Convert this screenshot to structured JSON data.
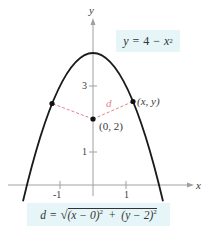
{
  "figure": {
    "axes": {
      "x_label": "x",
      "y_label": "y",
      "x_ticks": [
        {
          "value": -1,
          "label": "-1"
        },
        {
          "value": 1,
          "label": "1"
        }
      ],
      "y_ticks": [
        {
          "value": 1,
          "label": "1"
        },
        {
          "value": 3,
          "label": "3"
        }
      ]
    },
    "curve": {
      "equation_label": "y = 4 − x²",
      "equation_lhs": "y",
      "equation_eq": "=",
      "equation_rhs_const": "4",
      "equation_minus": "−",
      "equation_rhs_var": "x",
      "equation_rhs_exp": "2",
      "color": "#1a1a1a"
    },
    "points": {
      "center_label": "(0, 2)",
      "curve_point_label": "(x, y)",
      "center": {
        "x": 0,
        "y": 2
      },
      "curve_point": {
        "x": 1.21,
        "y": 2.54
      },
      "mirror_point": {
        "x": -1.24,
        "y": 2.46
      }
    },
    "distance": {
      "label": "d",
      "color": "#e0828a",
      "formula_lhs": "d",
      "formula_eq": "=",
      "formula_term1": "(x − 0)",
      "formula_term1_exp": "2",
      "formula_plus": "+",
      "formula_term2": "(y − 2)",
      "formula_term2_exp": "2"
    },
    "colors": {
      "axis": "#9a9a9a",
      "box_background": "#e6f5f7",
      "dashed_line": "#e0828a",
      "curve": "#1a1a1a",
      "text": "#3a3a3a"
    }
  }
}
